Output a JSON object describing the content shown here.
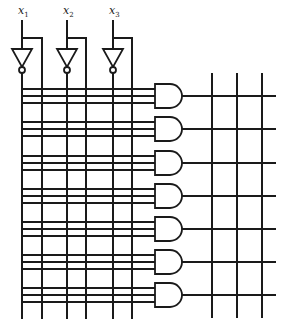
{
  "diagram": {
    "inputs": [
      {
        "name": "x",
        "subscript": "1",
        "x": 22,
        "complement_x": 42
      },
      {
        "name": "x",
        "subscript": "2",
        "x": 67,
        "complement_x": 86
      },
      {
        "name": "x",
        "subscript": "3",
        "x": 113,
        "complement_x": 132
      }
    ],
    "and_gates": {
      "count": 7,
      "centers_y": [
        96,
        129,
        163,
        196,
        229,
        262,
        295
      ],
      "inputs_per_gate": 3
    },
    "output_columns_x": [
      212,
      237,
      262
    ],
    "colors": {
      "line": "#1a1a1a",
      "background": "#ffffff"
    }
  }
}
